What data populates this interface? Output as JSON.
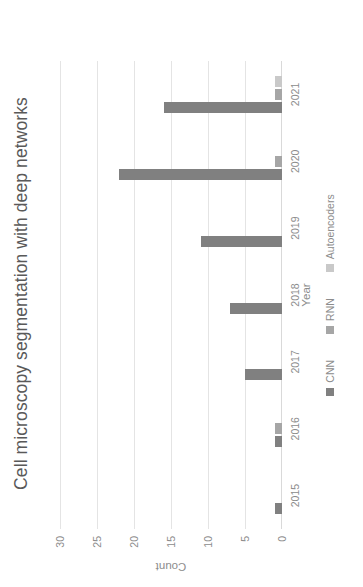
{
  "chart_data": {
    "type": "bar",
    "title": "Cell microscopy segmentation  with deep networks",
    "xlabel": "Year",
    "ylabel": "Count",
    "categories": [
      "2015",
      "2016",
      "2017",
      "2018",
      "2019",
      "2020",
      "2021"
    ],
    "series": [
      {
        "name": "CNN",
        "color": "#808080",
        "values": [
          1,
          1,
          5,
          7,
          11,
          22,
          16
        ]
      },
      {
        "name": "RNN",
        "color": "#a6a6a6",
        "values": [
          0,
          1,
          0,
          0,
          0,
          1,
          1
        ]
      },
      {
        "name": "Autoencoders",
        "color": "#c9c9c9",
        "values": [
          0,
          0,
          0,
          0,
          0,
          0,
          1
        ]
      }
    ],
    "ylim": [
      0,
      30
    ],
    "yticks": [
      "0",
      "5",
      "10",
      "15",
      "20",
      "25",
      "30"
    ],
    "ytick_values": [
      0,
      5,
      10,
      15,
      20,
      25,
      30
    ],
    "grid": true,
    "grid_axis": "y",
    "legend_position": "bottom",
    "orientation": "rotated-90-ccw"
  },
  "legend": {
    "items": [
      {
        "label": "CNN",
        "color": "#808080"
      },
      {
        "label": "RNN",
        "color": "#a6a6a6"
      },
      {
        "label": "Autoencoders",
        "color": "#c9c9c9"
      }
    ]
  }
}
